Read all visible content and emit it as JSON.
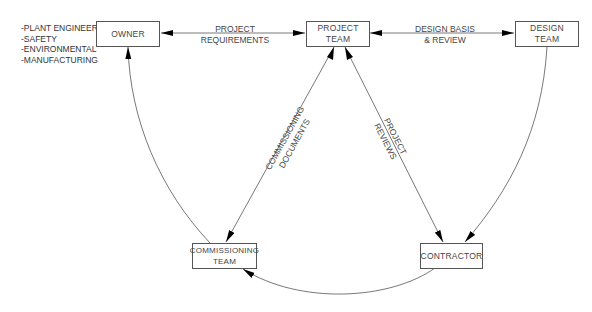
{
  "nodes": {
    "owner": {
      "line1": "OWNER",
      "line2": ""
    },
    "project_team": {
      "line1": "PROJECT",
      "line2": "TEAM"
    },
    "design_team": {
      "line1": "DESIGN",
      "line2": "TEAM"
    },
    "commissioning_team": {
      "line1": "COMMISSIONING",
      "line2": "TEAM"
    },
    "contractor": {
      "line1": "CONTRACTOR",
      "line2": ""
    }
  },
  "owner_notes": [
    "-PLANT ENGINEER",
    "-SAFETY",
    "-ENVIRONMENTAL",
    "-MANUFACTURING"
  ],
  "edges": {
    "project_requirements": {
      "line1": "PROJECT",
      "line2": "REQUIREMENTS"
    },
    "design_basis": {
      "line1": "DESIGN BASIS",
      "line2": "& REVIEW"
    },
    "commissioning_documents": {
      "line1": "COMMISSIONING",
      "line2": "DOCUMENTS"
    },
    "project_reviews": {
      "line1": "PROJECT",
      "line2": "REVIEWS"
    }
  },
  "colors": {
    "line": "#555555",
    "arrow": "#000000"
  }
}
